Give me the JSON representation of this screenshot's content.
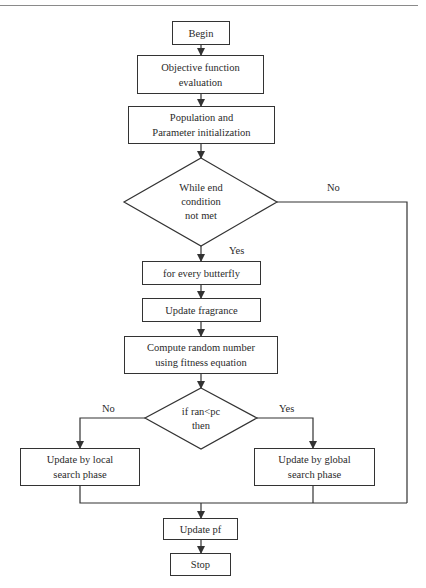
{
  "diagram": {
    "type": "flowchart",
    "nodes": {
      "begin": "Begin",
      "objective_line1": "Objective function",
      "objective_line2": "evaluation",
      "init_line1": "Population and",
      "init_line2": "Parameter initialization",
      "while_line1": "While end",
      "while_line2": "condition",
      "while_line3": "not met",
      "for_every": "for every butterfly",
      "update_fragrance": "Update fragrance",
      "compute_line1": "Compute random number",
      "compute_line2": "using fitness equation",
      "if_line1": "if ran<pc",
      "if_line2": "then",
      "local_line1": "Update by local",
      "local_line2": "search phase",
      "global_line1": "Update by global",
      "global_line2": "search phase",
      "update_pf": "Update pf",
      "stop": "Stop"
    },
    "edge_labels": {
      "while_no": "No",
      "while_yes": "Yes",
      "if_no": "No",
      "if_yes": "Yes"
    },
    "colors": {
      "line": "#333333",
      "background": "#ffffff"
    }
  }
}
